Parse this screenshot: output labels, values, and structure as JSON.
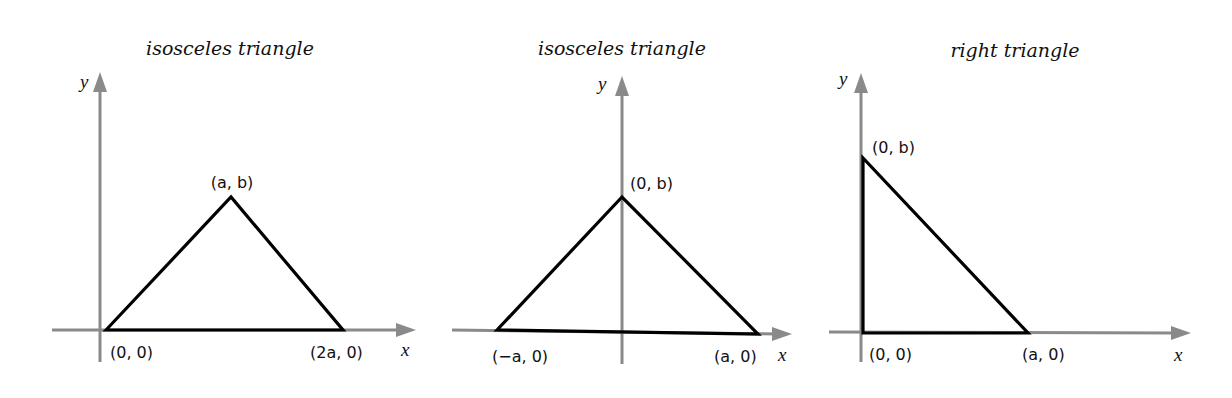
{
  "colors": {
    "axis": "#8a8a8a",
    "triangle": "#000000",
    "text": "#111111",
    "background": "#ffffff"
  },
  "panels": [
    {
      "title": "isosceles triangle",
      "x_axis_label": "x",
      "y_axis_label": "y",
      "vertices": [
        {
          "label": "(0, 0)",
          "x": 0,
          "y": 0
        },
        {
          "label": "(a, b)",
          "x": "a",
          "y": "b"
        },
        {
          "label": "(2a, 0)",
          "x": "2a",
          "y": 0
        }
      ]
    },
    {
      "title": "isosceles triangle",
      "x_axis_label": "x",
      "y_axis_label": "y",
      "vertices": [
        {
          "label": "(−a, 0)",
          "x": "-a",
          "y": 0
        },
        {
          "label": "(0, b)",
          "x": 0,
          "y": "b"
        },
        {
          "label": "(a, 0)",
          "x": "a",
          "y": 0
        }
      ]
    },
    {
      "title": "right triangle",
      "x_axis_label": "x",
      "y_axis_label": "y",
      "vertices": [
        {
          "label": "(0, 0)",
          "x": 0,
          "y": 0
        },
        {
          "label": "(0, b)",
          "x": 0,
          "y": "b"
        },
        {
          "label": "(a, 0)",
          "x": "a",
          "y": 0
        }
      ]
    }
  ]
}
